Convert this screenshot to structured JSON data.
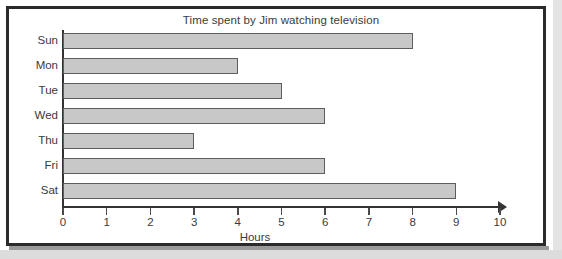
{
  "chart_data": {
    "type": "bar",
    "orientation": "horizontal",
    "title": "Time spent by Jim watching television",
    "xlabel": "Hours",
    "ylabel": "",
    "categories": [
      "Sun",
      "Mon",
      "Tue",
      "Wed",
      "Thu",
      "Fri",
      "Sat"
    ],
    "values": [
      8,
      4,
      5,
      6,
      3,
      6,
      9
    ],
    "xlim": [
      0,
      10
    ],
    "xticks": [
      0,
      1,
      2,
      3,
      4,
      5,
      6,
      7,
      8,
      9,
      10
    ],
    "xtick_labels": [
      "0",
      "1",
      "2",
      "3",
      "4",
      "5",
      "6",
      "7",
      "8",
      "9",
      "10"
    ],
    "grid": false,
    "legend": false,
    "bar_fill_color": "#c8c8c8",
    "bar_border_color": "#5d5d5d",
    "axis_color": "#333333",
    "text_color": "#3a3a3a",
    "background_color": "#ffffff",
    "frame_color": "#2b2b2b"
  }
}
